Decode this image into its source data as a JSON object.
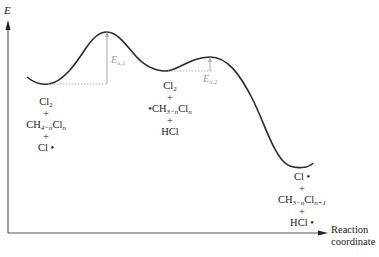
{
  "diagram": {
    "type": "reaction-energy-profile",
    "y_axis_label": "E",
    "x_axis_label_line1": "Reaction",
    "x_axis_label_line2": "coordinate",
    "colors": {
      "curve": "#2b2b2b",
      "axis": "#555555",
      "activation": "#a8a8a8"
    },
    "activation_energies": [
      {
        "symbol": "E",
        "subscript": "a,1"
      },
      {
        "symbol": "E",
        "subscript": "a,2"
      }
    ],
    "states": [
      {
        "name": "reactants",
        "lines": [
          {
            "main": "Cl",
            "sub": "2",
            "after": ""
          },
          {
            "main": "+",
            "sub": "",
            "after": ""
          },
          {
            "main": "CH",
            "sub": "4−n",
            "after": "Cl",
            "sub2": "n"
          },
          {
            "main": "+",
            "sub": "",
            "after": ""
          },
          {
            "main": "Cl •",
            "sub": "",
            "after": ""
          }
        ]
      },
      {
        "name": "intermediate",
        "lines": [
          {
            "main": "Cl",
            "sub": "2"
          },
          {
            "main": "+"
          },
          {
            "main": "•CH",
            "sub": "3−n",
            "after": "Cl",
            "sub2": "n"
          },
          {
            "main": "+"
          },
          {
            "main": "HCl"
          }
        ]
      },
      {
        "name": "products",
        "lines": [
          {
            "main": "Cl •"
          },
          {
            "main": "+"
          },
          {
            "main": "CH",
            "sub": "3−n",
            "after": "Cl",
            "sub2": "n+1"
          },
          {
            "main": "+"
          },
          {
            "main": "HCl •"
          }
        ]
      }
    ]
  }
}
